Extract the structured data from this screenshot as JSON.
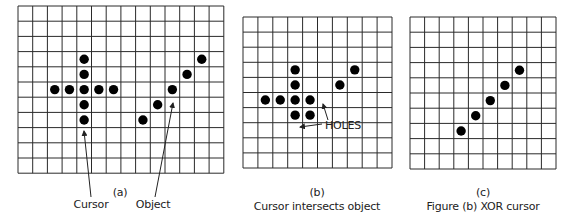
{
  "style": {
    "line_color": "#2a2a2a",
    "dot_color": "#000000",
    "dot_radius": 4.7
  },
  "panels": [
    {
      "id": "a",
      "grid": {
        "x": 18,
        "y": 6,
        "cols": 14,
        "rows": 11,
        "cell_w": 14.7,
        "cell_h": 15.2
      },
      "dots": [
        [
          4,
          3
        ],
        [
          4,
          4
        ],
        [
          2,
          5
        ],
        [
          3,
          5
        ],
        [
          4,
          5
        ],
        [
          5,
          5
        ],
        [
          6,
          5
        ],
        [
          4,
          6
        ],
        [
          4,
          7
        ],
        [
          8,
          7
        ],
        [
          9,
          6
        ],
        [
          10,
          5
        ],
        [
          11,
          4
        ],
        [
          12,
          3
        ]
      ],
      "tag": "(a)",
      "labels": [
        "Cursor",
        "Object"
      ]
    },
    {
      "id": "b",
      "grid": {
        "x": 243,
        "y": 17,
        "cols": 10,
        "rows": 10,
        "cell_w": 14.9,
        "cell_h": 15.1
      },
      "dots": [
        [
          3,
          3
        ],
        [
          7,
          3
        ],
        [
          3,
          4
        ],
        [
          6,
          4
        ],
        [
          1,
          5
        ],
        [
          2,
          5
        ],
        [
          3,
          5
        ],
        [
          4,
          5
        ],
        [
          3,
          6
        ],
        [
          4,
          6
        ]
      ],
      "tag": "(b)",
      "caption": "Cursor intersects object",
      "annotation": "HOLES"
    },
    {
      "id": "c",
      "grid": {
        "x": 410,
        "y": 17,
        "cols": 10,
        "rows": 10,
        "cell_w": 14.6,
        "cell_h": 15.2
      },
      "dots": [
        [
          7,
          3
        ],
        [
          6,
          4
        ],
        [
          5,
          5
        ],
        [
          4,
          6
        ],
        [
          3,
          7
        ]
      ],
      "tag": "(c)",
      "caption": "Figure (b) XOR cursor"
    }
  ],
  "arrows": [
    {
      "name": "cursor-arrow",
      "from": [
        91,
        197
      ],
      "to": [
        84,
        131
      ]
    },
    {
      "name": "object-arrow",
      "from": [
        155,
        197
      ],
      "to": [
        173,
        103
      ]
    },
    {
      "name": "holes-arrow-up",
      "from": [
        328,
        120
      ],
      "to": [
        323,
        104
      ]
    },
    {
      "name": "holes-arrow-left",
      "from": [
        322,
        124
      ],
      "to": [
        300,
        127
      ]
    }
  ]
}
